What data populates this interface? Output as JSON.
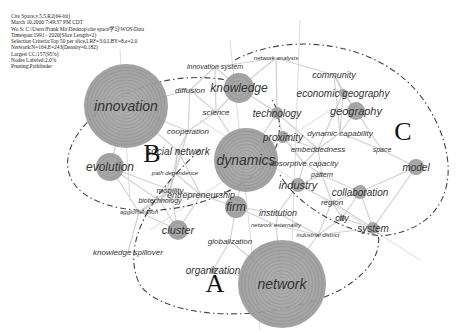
{
  "figure": {
    "type": "keyword co-occurrence network (CiteSpace)",
    "metadata_lines": [
      "Cite Space,v.5.5.R2(64-bit)",
      "March 10,2000 7:49:37 PM CDT",
      "Wo S: C:\\Users\\Frank Ma\\Desktop\\cite space学习\\WOS\\Data",
      "Timespan:1991 - 2020(Slice Length=2)",
      "Selection Criteria:Top 50 per slice,LRF=3.0,LBY=8,e=2.0",
      "Network:N=164,E=243(Density=0.182)",
      "Largest CC:157(95%)",
      "Nodes Labeled:2.0%",
      "Pruning:Pathfinder"
    ],
    "cluster_labels": [
      {
        "id": "A",
        "x": 215,
        "y": 292
      },
      {
        "id": "B",
        "x": 152,
        "y": 162
      },
      {
        "id": "C",
        "x": 403,
        "y": 140
      }
    ],
    "nodes": [
      {
        "label": "innovation",
        "x": 126,
        "y": 106,
        "r": 42,
        "size": 14
      },
      {
        "label": "network",
        "x": 282,
        "y": 284,
        "r": 44,
        "size": 14
      },
      {
        "label": "dynamics",
        "x": 246,
        "y": 160,
        "r": 32,
        "size": 14
      },
      {
        "label": "knowledge",
        "x": 239,
        "y": 88,
        "r": 15,
        "size": 12
      },
      {
        "label": "evolution",
        "x": 110,
        "y": 167,
        "r": 14,
        "size": 12
      },
      {
        "label": "technology",
        "x": 277,
        "y": 113,
        "r": 6,
        "size": 10
      },
      {
        "label": "proximity",
        "x": 283,
        "y": 137,
        "r": 6,
        "size": 10
      },
      {
        "label": "geography",
        "x": 356,
        "y": 111,
        "r": 9,
        "size": 11
      },
      {
        "label": "economic geography",
        "x": 343,
        "y": 93,
        "r": 4,
        "size": 10
      },
      {
        "label": "community",
        "x": 334,
        "y": 75,
        "r": 0,
        "size": 9
      },
      {
        "label": "model",
        "x": 416,
        "y": 167,
        "r": 8,
        "size": 10
      },
      {
        "label": "industry",
        "x": 298,
        "y": 185,
        "r": 7,
        "size": 11
      },
      {
        "label": "collaboration",
        "x": 360,
        "y": 192,
        "r": 7,
        "size": 10
      },
      {
        "label": "system",
        "x": 373,
        "y": 228,
        "r": 6,
        "size": 10
      },
      {
        "label": "firm",
        "x": 236,
        "y": 207,
        "r": 11,
        "size": 12
      },
      {
        "label": "cluster",
        "x": 178,
        "y": 230,
        "r": 10,
        "size": 11
      },
      {
        "label": "organization",
        "x": 213,
        "y": 270,
        "r": 3,
        "size": 10
      },
      {
        "label": "city",
        "x": 342,
        "y": 218,
        "r": 3,
        "size": 9
      },
      {
        "label": "social network",
        "x": 178,
        "y": 151,
        "r": 2,
        "size": 10
      },
      {
        "label": "diffusion",
        "x": 190,
        "y": 90,
        "r": 0,
        "size": 8
      },
      {
        "label": "science",
        "x": 216,
        "y": 112,
        "r": 0,
        "size": 8
      },
      {
        "label": "cooperation",
        "x": 188,
        "y": 131,
        "r": 0,
        "size": 8
      },
      {
        "label": "innovation system",
        "x": 215,
        "y": 67,
        "r": 0,
        "size": 7
      },
      {
        "label": "network analysis",
        "x": 276,
        "y": 58,
        "r": 0,
        "size": 6
      },
      {
        "label": "dynamic capability",
        "x": 340,
        "y": 133,
        "r": 0,
        "size": 8
      },
      {
        "label": "embeddedness",
        "x": 318,
        "y": 149,
        "r": 0,
        "size": 8
      },
      {
        "label": "space",
        "x": 382,
        "y": 150,
        "r": 0,
        "size": 7
      },
      {
        "label": "absorptive capacity",
        "x": 304,
        "y": 163,
        "r": 0,
        "size": 8
      },
      {
        "label": "pattern",
        "x": 322,
        "y": 175,
        "r": 0,
        "size": 7
      },
      {
        "label": "path dependence",
        "x": 175,
        "y": 173,
        "r": 0,
        "size": 6
      },
      {
        "label": "mobility",
        "x": 170,
        "y": 190,
        "r": 0,
        "size": 8
      },
      {
        "label": "entrepreneurship",
        "x": 201,
        "y": 195,
        "r": 0,
        "size": 9
      },
      {
        "label": "biotechnology",
        "x": 160,
        "y": 201,
        "r": 0,
        "size": 7
      },
      {
        "label": "agglomeration",
        "x": 139,
        "y": 212,
        "r": 0,
        "size": 6
      },
      {
        "label": "region",
        "x": 332,
        "y": 202,
        "r": 0,
        "size": 8
      },
      {
        "label": "institution",
        "x": 278,
        "y": 213,
        "r": 0,
        "size": 9
      },
      {
        "label": "network externality",
        "x": 276,
        "y": 225,
        "r": 0,
        "size": 6
      },
      {
        "label": "industrial district",
        "x": 318,
        "y": 235,
        "r": 0,
        "size": 6
      },
      {
        "label": "globalization",
        "x": 230,
        "y": 241,
        "r": 0,
        "size": 8
      },
      {
        "label": "knowledge spillover",
        "x": 128,
        "y": 252,
        "r": 0,
        "size": 8
      }
    ]
  }
}
